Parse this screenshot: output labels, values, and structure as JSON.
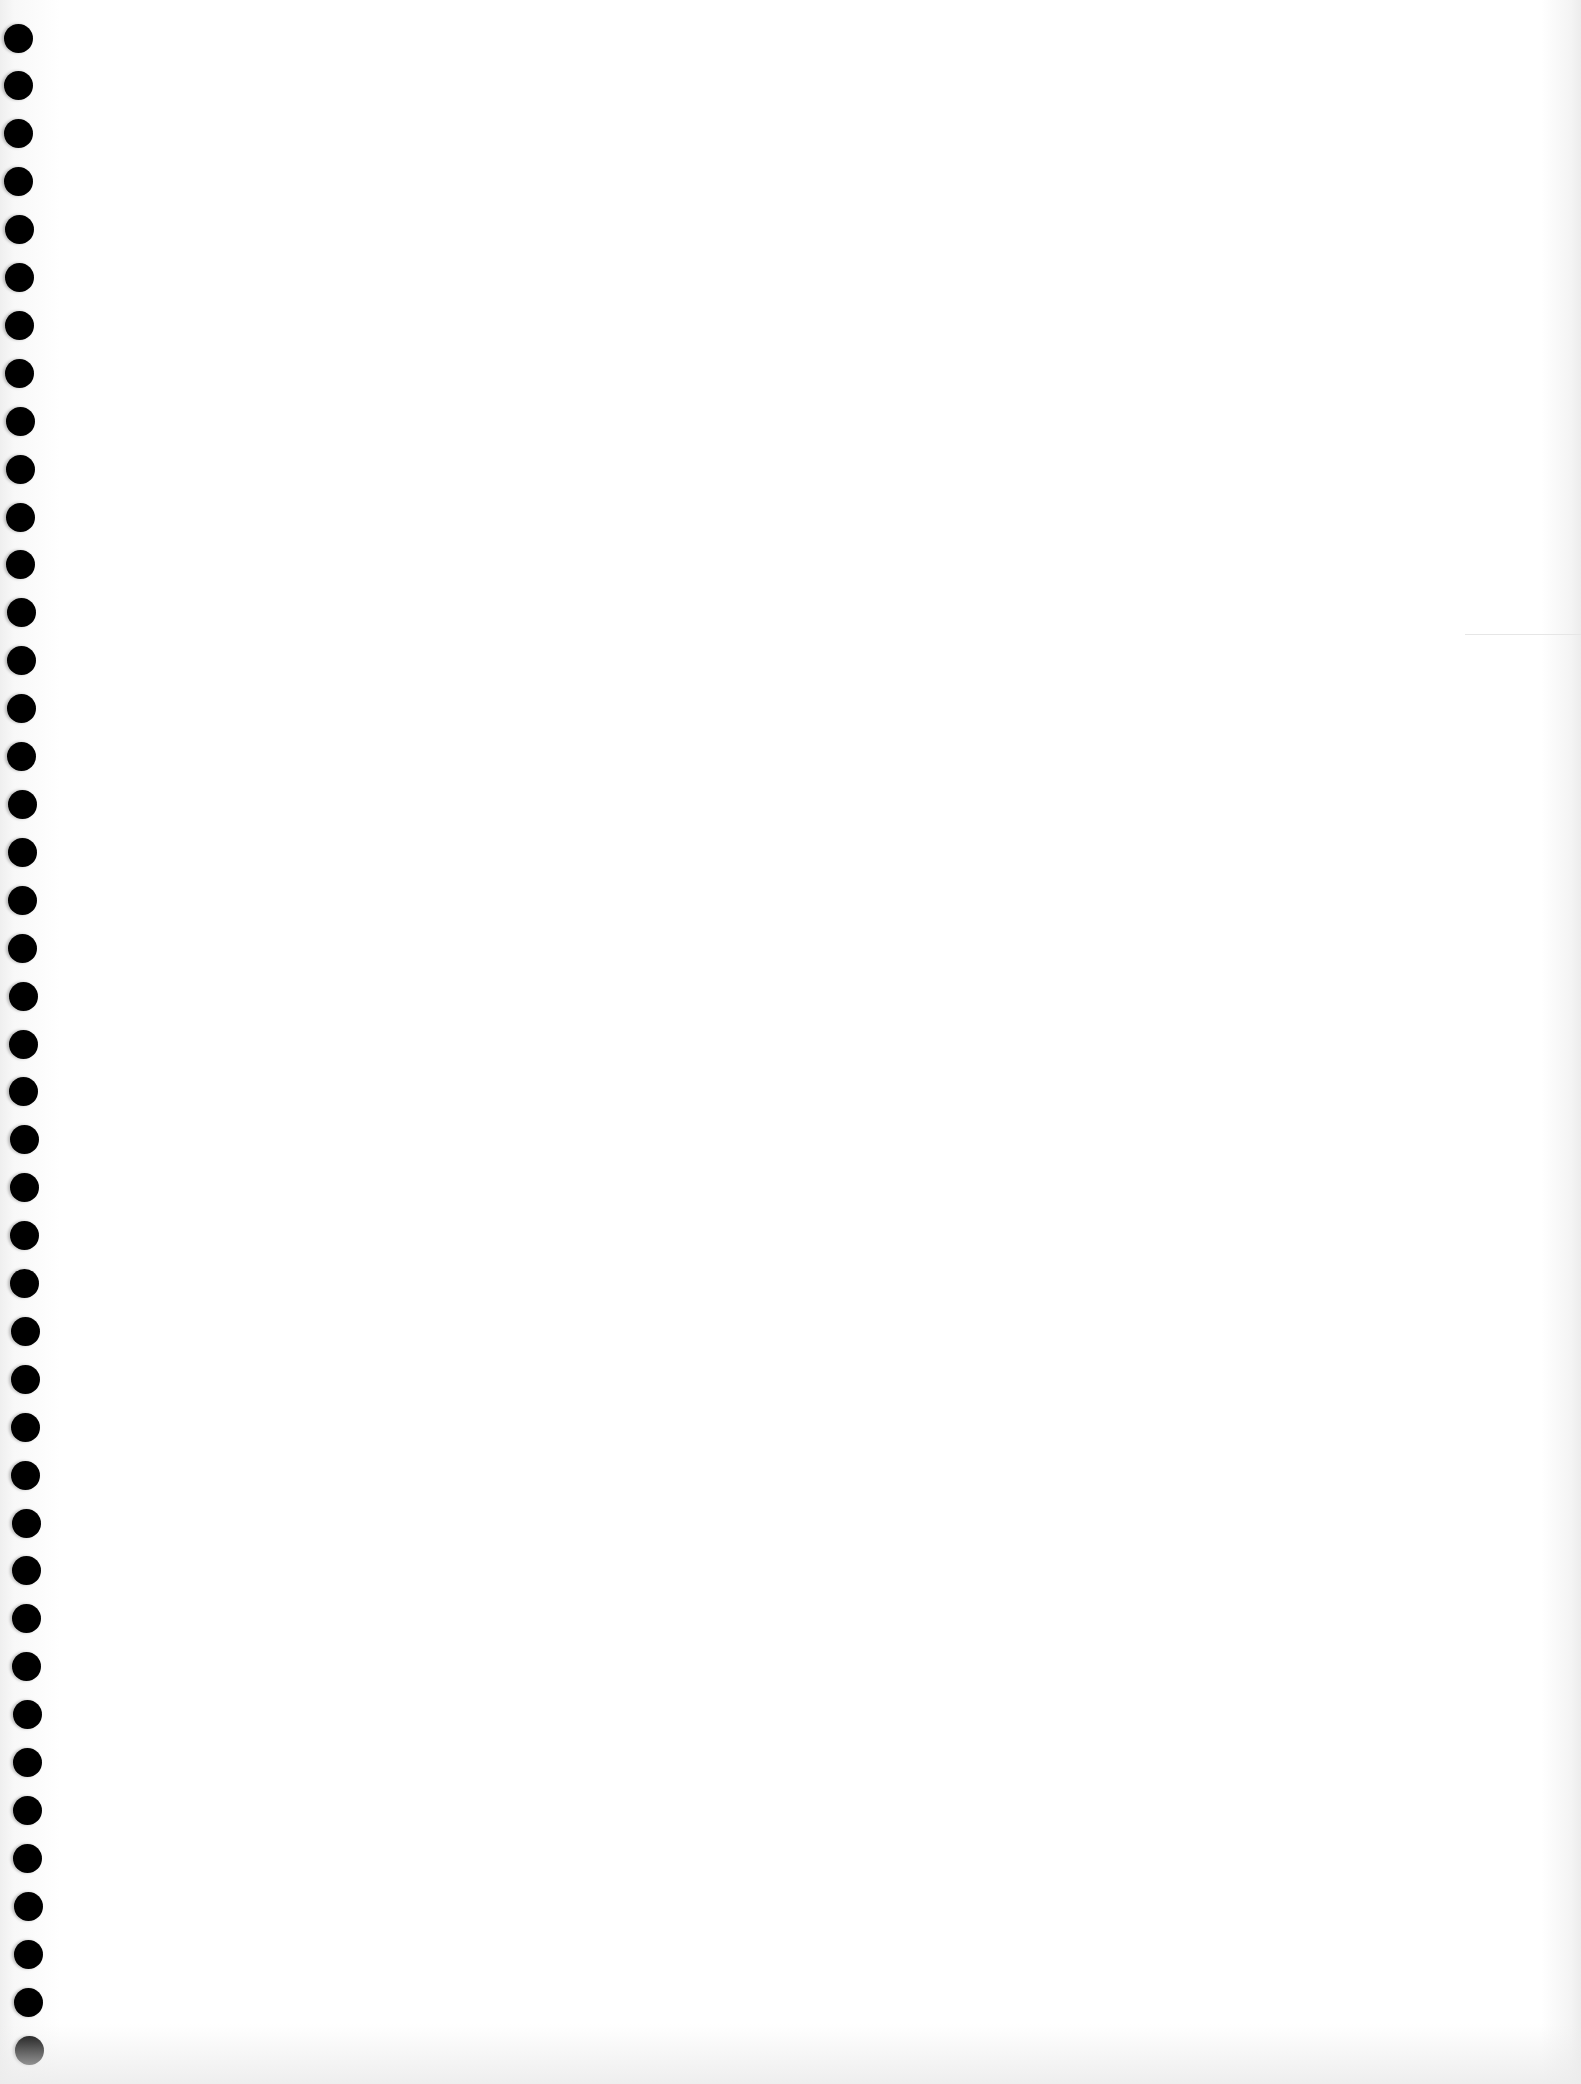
{
  "page": {
    "type": "blank-notebook-sheet",
    "background_color": "#ffffff",
    "text_content": []
  },
  "binding_holes": {
    "count": 43,
    "color": "#000000",
    "diameter_px": 29,
    "first_center": [
      18,
      38
    ],
    "last_center": [
      29,
      2050
    ]
  },
  "edge_rule": {
    "y": 634,
    "color": "#e6e6e6"
  }
}
